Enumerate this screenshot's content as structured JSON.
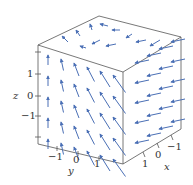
{
  "chart_data": {
    "type": "vector_field_3d",
    "title": "",
    "axes": {
      "x": {
        "label": "x",
        "ticks": [
          "1",
          "0",
          "−1"
        ],
        "range": [
          -2,
          2
        ]
      },
      "y": {
        "label": "y",
        "ticks": [
          "−1",
          "0",
          "1"
        ],
        "range": [
          -2,
          2
        ]
      },
      "z": {
        "label": "z",
        "ticks": [
          "1",
          "0",
          "−1"
        ],
        "range": [
          -2,
          2
        ]
      }
    },
    "arrow_color": "#4a6fb5",
    "box_color": "#555555",
    "grid": false,
    "legend": null
  },
  "labels": {
    "z_axis": "z",
    "z_ticks": [
      "1",
      "0",
      "−1"
    ],
    "y_axis": "y",
    "y_ticks": [
      "−1",
      "0",
      "1"
    ],
    "x_axis": "x",
    "x_ticks": [
      "1",
      "0",
      "−1"
    ]
  }
}
